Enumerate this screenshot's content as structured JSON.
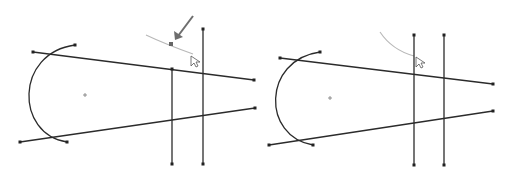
{
  "figure": {
    "colors": {
      "background": "#ffffff",
      "sketch_line": "#2b2b2b",
      "preview_curve": "#b8b8b8",
      "arrow": "#6e6e6e",
      "endpoint": "#222222"
    }
  },
  "panels": [
    {
      "name": "before",
      "top_line": {
        "x1": 33,
        "y1": 52,
        "x2": 254,
        "y2": 80
      },
      "bottom_line": {
        "x1": 20,
        "y1": 142,
        "x2": 255,
        "y2": 108
      },
      "arc": {
        "x1": 75,
        "y1": 45,
        "x2": 67,
        "y2": 142,
        "leftmost_x": 33,
        "leftmost_y": 96
      },
      "center_mark": {
        "x": 85,
        "y": 95
      },
      "vertical_lines": [
        {
          "x": 172,
          "y1": 69,
          "y2": 164
        },
        {
          "x": 203,
          "y1": 29,
          "y2": 164
        }
      ],
      "preview_curve": {
        "x1": 146,
        "y1": 35,
        "cx": 165,
        "cy": 44,
        "x2": 193,
        "y2": 54,
        "handle_x": 171,
        "handle_y": 44
      },
      "arrow": {
        "x1": 193,
        "y1": 16,
        "x2": 175,
        "y2": 40
      },
      "cursor": {
        "x": 191,
        "y": 56
      }
    },
    {
      "name": "after",
      "top_line": {
        "x1": 280,
        "y1": 58,
        "x2": 493,
        "y2": 84
      },
      "bottom_line": {
        "x1": 269,
        "y1": 145,
        "x2": 493,
        "y2": 111
      },
      "arc": {
        "x1": 320,
        "y1": 52,
        "x2": 313,
        "y2": 145,
        "leftmost_x": 280,
        "leftmost_y": 98
      },
      "center_mark": {
        "x": 330,
        "y": 98
      },
      "vertical_lines": [
        {
          "x": 414,
          "y1": 35,
          "y2": 165
        },
        {
          "x": 444,
          "y1": 35,
          "y2": 165
        }
      ],
      "preview_curve": {
        "x1": 380,
        "y1": 32,
        "cx": 392,
        "cy": 50,
        "x2": 414,
        "y2": 56
      },
      "cursor": {
        "x": 416,
        "y": 57
      }
    }
  ]
}
